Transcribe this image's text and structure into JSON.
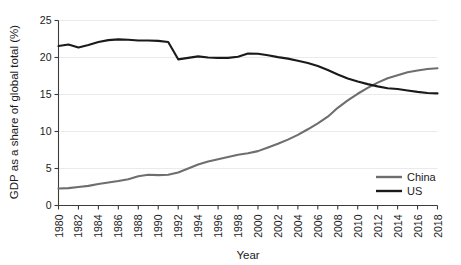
{
  "chart_data": {
    "type": "line",
    "title": "",
    "xlabel": "Year",
    "ylabel": "GDP as a share of global total (%)",
    "xlim": [
      1980,
      2018
    ],
    "ylim": [
      0,
      25
    ],
    "grid": true,
    "legend_position": "bottom-right",
    "x": [
      1980,
      1981,
      1982,
      1983,
      1984,
      1985,
      1986,
      1987,
      1988,
      1989,
      1990,
      1991,
      1992,
      1993,
      1994,
      1995,
      1996,
      1997,
      1998,
      1999,
      2000,
      2001,
      2002,
      2003,
      2004,
      2005,
      2006,
      2007,
      2008,
      2009,
      2010,
      2011,
      2012,
      2013,
      2014,
      2015,
      2016,
      2017,
      2018
    ],
    "xticks": [
      "1980",
      "1982",
      "1984",
      "1986",
      "1988",
      "1990",
      "1992",
      "1994",
      "1996",
      "1998",
      "2000",
      "2002",
      "2004",
      "2006",
      "2008",
      "2010",
      "2012",
      "2014",
      "2016",
      "2018"
    ],
    "yticks": [
      "0",
      "5",
      "10",
      "15",
      "20",
      "25"
    ],
    "series": [
      {
        "name": "China",
        "color": "#6e6e6e",
        "values": [
          2.3,
          2.35,
          2.5,
          2.65,
          2.9,
          3.1,
          3.3,
          3.55,
          3.95,
          4.15,
          4.1,
          4.15,
          4.45,
          5.0,
          5.55,
          5.95,
          6.25,
          6.55,
          6.85,
          7.05,
          7.35,
          7.85,
          8.35,
          8.9,
          9.55,
          10.3,
          11.1,
          12.0,
          13.2,
          14.2,
          15.1,
          15.9,
          16.6,
          17.2,
          17.6,
          18.0,
          18.25,
          18.45,
          18.55
        ]
      },
      {
        "name": "US",
        "color": "#1a1a1a",
        "values": [
          21.55,
          21.75,
          21.35,
          21.7,
          22.1,
          22.35,
          22.45,
          22.4,
          22.3,
          22.3,
          22.25,
          22.1,
          19.75,
          19.95,
          20.15,
          20.0,
          19.95,
          19.95,
          20.1,
          20.55,
          20.5,
          20.3,
          20.05,
          19.85,
          19.55,
          19.25,
          18.85,
          18.3,
          17.7,
          17.15,
          16.75,
          16.4,
          16.1,
          15.85,
          15.75,
          15.55,
          15.35,
          15.2,
          15.15
        ]
      }
    ]
  },
  "legend": {
    "items": [
      {
        "label": "China",
        "color": "#6e6e6e"
      },
      {
        "label": "US",
        "color": "#1a1a1a"
      }
    ]
  }
}
